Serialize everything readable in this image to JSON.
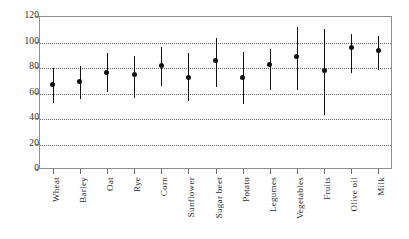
{
  "chart_data": {
    "type": "scatter",
    "title": "",
    "subtitle": "",
    "xlabel": "",
    "ylabel": "",
    "ylim": [
      0,
      120
    ],
    "yticks": [
      0,
      20,
      40,
      60,
      80,
      100,
      120
    ],
    "ytick_labels": [
      "0",
      "20",
      "40",
      "60",
      "80",
      "100",
      "120"
    ],
    "grid": true,
    "legend": "none",
    "marker_style": "filled-circle-with-vertical-error-bar",
    "categories": [
      "Wheat",
      "Barley",
      "Oat",
      "Rye",
      "Corn",
      "Sunflower",
      "Sugar beet",
      "Potato",
      "Legumes",
      "Vegetables",
      "Fruits",
      "Olive oil",
      "Milk"
    ],
    "values": [
      66,
      69,
      76,
      74,
      81,
      72,
      85,
      72,
      82,
      88,
      77,
      95,
      93
    ],
    "error_low": [
      52,
      55,
      60,
      56,
      65,
      53,
      64,
      51,
      62,
      62,
      42,
      75,
      78
    ],
    "error_high": [
      79,
      81,
      91,
      89,
      96,
      91,
      103,
      92,
      94,
      111,
      110,
      106,
      104
    ],
    "series": [
      {
        "name": "mean with range",
        "values": [
          66,
          69,
          76,
          74,
          81,
          72,
          85,
          72,
          82,
          88,
          77,
          95,
          93
        ]
      }
    ]
  },
  "colors": {
    "marker": "#111111",
    "error_bar": "#121212",
    "grid": "#4a4a4a",
    "frame": "#8d8d8d",
    "text": "#2b2b2b",
    "background": "#ffffff"
  }
}
